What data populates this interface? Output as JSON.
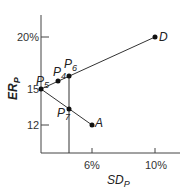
{
  "axes": {
    "y_label": "ER",
    "y_label_sub": "P",
    "x_label": "SD",
    "x_label_sub": "P",
    "y_ticks": [
      {
        "label": "20%",
        "y": 37
      },
      {
        "label": "15",
        "y": 89
      },
      {
        "label": "12",
        "y": 125
      }
    ],
    "x_ticks": [
      {
        "label": "6%",
        "x": 92
      },
      {
        "label": "10%",
        "x": 155
      }
    ]
  },
  "points": [
    {
      "id": "P5",
      "label": "P",
      "sub": "5",
      "sd": 0,
      "er": 15
    },
    {
      "id": "P4",
      "label": "P",
      "sub": "4",
      "er": 15.5
    },
    {
      "id": "P6",
      "label": "P",
      "sub": "6",
      "er": 16
    },
    {
      "id": "D",
      "label": "D",
      "sd": 10,
      "er": 20
    },
    {
      "id": "P7",
      "label": "P",
      "sub": "7",
      "er": 13.6
    },
    {
      "id": "A",
      "label": "A",
      "sd": 6,
      "er": 12
    }
  ],
  "colors": {
    "line": "#333333",
    "point": "#111111"
  }
}
